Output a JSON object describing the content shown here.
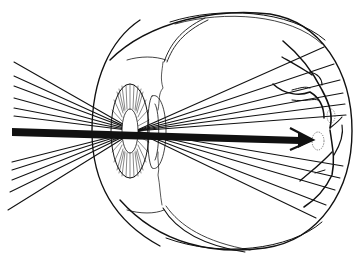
{
  "diagram": {
    "colors": {
      "background": "#ffffff",
      "ink": "#111111"
    },
    "parts": [
      "sclera",
      "cornea",
      "iris",
      "lens",
      "retina",
      "blood-vessels",
      "optic-disc",
      "light-rays",
      "central-ray-arrow"
    ]
  }
}
